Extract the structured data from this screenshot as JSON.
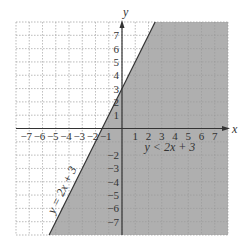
{
  "chart_data": {
    "type": "inequality-graph",
    "title": "",
    "xlabel": "x",
    "ylabel": "y",
    "xlim": [
      -8,
      8
    ],
    "ylim": [
      -8,
      8
    ],
    "grid": true,
    "x_ticks": [
      -7,
      -6,
      -5,
      -4,
      -3,
      -2,
      -1,
      1,
      2,
      3,
      4,
      5,
      6,
      7
    ],
    "y_ticks": [
      -7,
      -6,
      -5,
      -4,
      -3,
      -2,
      1,
      2,
      3,
      4,
      5,
      6,
      7
    ],
    "x_tick_labels": [
      "−7",
      "−6",
      "−5",
      "−4",
      "−3",
      "−2",
      "−1",
      "1",
      "2",
      "3",
      "4",
      "5",
      "6",
      "7"
    ],
    "y_tick_labels": [
      "−7",
      "−6",
      "−5",
      "−4",
      "−3",
      "−2",
      "1",
      "2",
      "3",
      "4",
      "5",
      "6",
      "7"
    ],
    "boundary_line": {
      "equation": "y = 2x + 3",
      "slope": 2,
      "intercept": 3,
      "style": "solid"
    },
    "shaded_region": {
      "inequality": "y < 2x + 3",
      "side": "below-right",
      "color": "#a6a6a6"
    },
    "annotations": [
      {
        "text": "y = 2x + 3",
        "position": "along line, lower left"
      },
      {
        "text": "y < 2x + 3",
        "position": [
          3.5,
          -1.8
        ]
      }
    ]
  },
  "labels": {
    "x_axis": "x",
    "y_axis": "y",
    "line_label": "y = 2x + 3",
    "region_label": "y < 2x + 3"
  },
  "colors": {
    "shade": "#a6a6a6",
    "grid": "#c8c8c8",
    "axis": "#333333"
  }
}
